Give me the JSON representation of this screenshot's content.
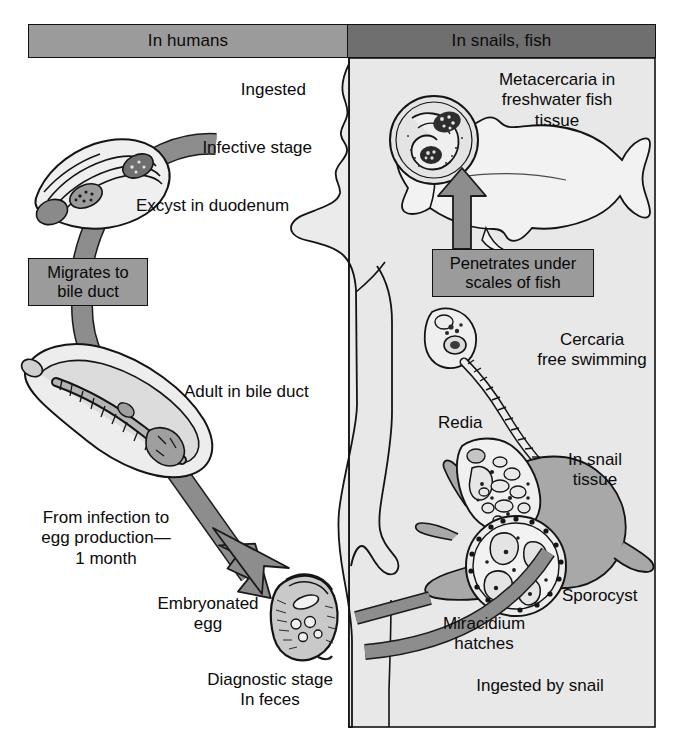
{
  "diagram": {
    "type": "life-cycle",
    "panels": [
      {
        "id": "humans",
        "label": "In humans",
        "fill": "#9b9b9b"
      },
      {
        "id": "snails_fish",
        "label": "In snails, fish",
        "fill": "#6f6f6f"
      }
    ],
    "colors": {
      "panel_humans": "#9b9b9b",
      "panel_snails": "#6f6f6f",
      "right_background": "#e8e8e8",
      "arrow_fill": "#8d8d8d",
      "arrow_stroke": "#1a1a1a",
      "body_fill": "#ebebeb",
      "snail_fill": "#a8a8a8",
      "organism_light": "#e2e2e2",
      "organism_mid": "#a9a9a9",
      "text": "#0b0b0b"
    },
    "callouts": [
      {
        "id": "migrates",
        "text": "Migrates to\nbile duct"
      },
      {
        "id": "penetrates",
        "text": "Penetrates under\nscales of fish"
      }
    ],
    "labels": {
      "ingested": "Ingested",
      "infective_stage": "Infective stage",
      "excyst": "Excyst in duodenum",
      "adult": "Adult in bile duct",
      "from_infection": "From infection to\negg production—\n1 month",
      "embryonated_egg": "Embryonated\negg",
      "diagnostic_stage": "Diagnostic stage\nIn feces",
      "metacercaria": "Metacercaria in\nfreshwater fish\ntissue",
      "cercaria": "Cercaria\nfree swimming",
      "redia": "Redia",
      "in_snail_tissue": "In snail\ntissue",
      "sporocyst": "Sporocyst",
      "miracidium": "Miracidium\nhatches",
      "ingested_by_snail": "Ingested by snail"
    },
    "stages": [
      "Metacercaria in freshwater fish tissue",
      "Ingested — infective stage",
      "Excyst in duodenum",
      "Migrates to bile duct",
      "Adult in bile duct",
      "Embryonated egg — diagnostic stage in feces",
      "Ingested by snail",
      "Miracidium hatches",
      "Sporocyst",
      "Redia",
      "Cercaria free swimming",
      "Penetrates under scales of fish"
    ]
  }
}
